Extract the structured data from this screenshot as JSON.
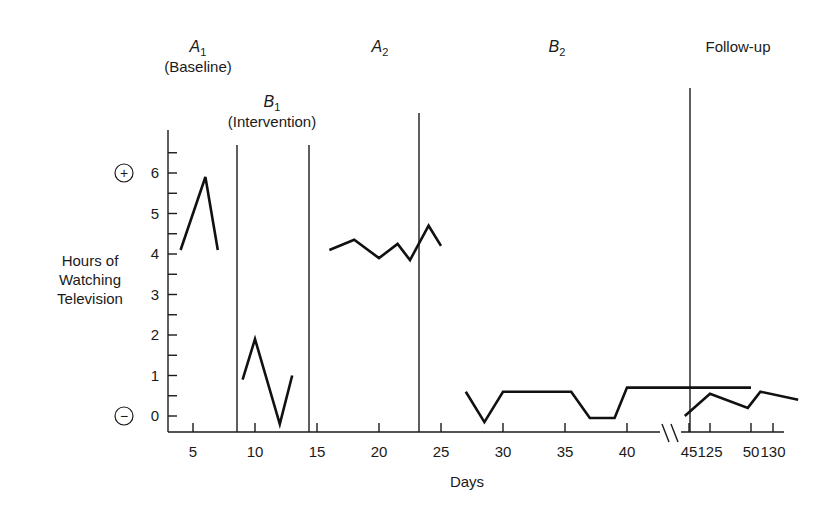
{
  "chart_data": {
    "type": "line",
    "title": "",
    "xlabel": "Days",
    "ylabel": "Hours of Watching Television",
    "ylabel_lines": [
      "Hours of",
      "Watching",
      "Television"
    ],
    "ylim": [
      0,
      6
    ],
    "y_ticks": [
      "0",
      "1",
      "2",
      "3",
      "4",
      "5",
      "6"
    ],
    "y_symbols": {
      "top": "+",
      "bottom": "−"
    },
    "x_ticks": [
      "5",
      "10",
      "15",
      "20",
      "25",
      "30",
      "35",
      "40",
      "45",
      "50",
      "125",
      "130"
    ],
    "axis_break": "between 50 and 125",
    "grid": false,
    "phases": [
      {
        "name": "A1",
        "letter": "A",
        "sub": "1",
        "desc": "(Baseline)"
      },
      {
        "name": "B1",
        "letter": "B",
        "sub": "1",
        "desc": "(Intervention)"
      },
      {
        "name": "A2",
        "letter": "A",
        "sub": "2",
        "desc": ""
      },
      {
        "name": "B2",
        "letter": "B",
        "sub": "2",
        "desc": ""
      },
      {
        "name": "Follow-up",
        "letter": "Follow-up",
        "sub": "",
        "desc": ""
      }
    ],
    "series": [
      {
        "name": "A1 (Baseline)",
        "x": [
          4,
          6,
          7
        ],
        "y": [
          4.1,
          5.9,
          4.1
        ]
      },
      {
        "name": "B1 (Intervention)",
        "x": [
          9,
          10,
          12,
          13
        ],
        "y": [
          0.9,
          1.9,
          -0.2,
          1.0
        ]
      },
      {
        "name": "A2",
        "x": [
          16,
          18,
          20,
          21.5,
          22.5,
          24,
          25
        ],
        "y": [
          4.1,
          4.35,
          3.9,
          4.25,
          3.85,
          4.7,
          4.2
        ]
      },
      {
        "name": "B2",
        "x": [
          27,
          28.5,
          30,
          32,
          34,
          35.5,
          37,
          39,
          40,
          50
        ],
        "y": [
          0.6,
          -0.15,
          0.6,
          0.6,
          0.6,
          0.6,
          -0.05,
          -0.05,
          0.7,
          0.7
        ]
      },
      {
        "name": "Follow-up",
        "x": [
          123,
          125,
          128,
          129,
          132
        ],
        "y": [
          0.0,
          0.55,
          0.2,
          0.6,
          0.4
        ]
      }
    ]
  }
}
